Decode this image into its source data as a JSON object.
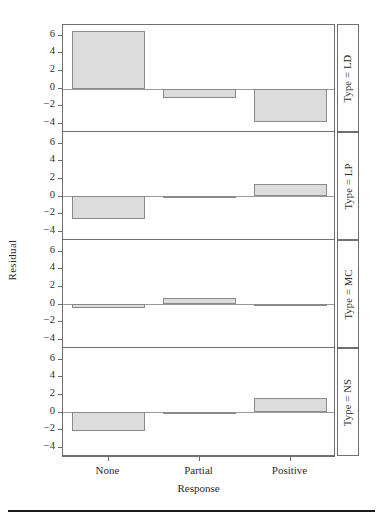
{
  "chart_data": {
    "type": "bar",
    "title": "",
    "subtitle": "",
    "xlabel": "Response",
    "ylabel": "Residual",
    "categories": [
      "None",
      "Partial",
      "Positive"
    ],
    "ylim": [
      -5,
      7.2
    ],
    "yticks": [
      6,
      4,
      2,
      0,
      -2,
      -4
    ],
    "ytick_labels": [
      "6",
      "4",
      "2",
      "0",
      "-2",
      "-4"
    ],
    "grid": false,
    "legend": null,
    "facet_variable": "Type",
    "panels": [
      {
        "label": "Type = LD",
        "facet_value": "LD",
        "values": [
          6.5,
          -1.0,
          -3.8
        ]
      },
      {
        "label": "Type = LP",
        "facet_value": "LP",
        "values": [
          -2.6,
          -0.15,
          1.3
        ]
      },
      {
        "label": "Type = MC",
        "facet_value": "MC",
        "values": [
          -0.45,
          0.65,
          -0.05
        ]
      },
      {
        "label": "Type = NS",
        "facet_value": "NS",
        "values": [
          -2.2,
          -0.2,
          1.5
        ]
      }
    ],
    "bar_fill_color": "#dcdcdc",
    "bar_edge_color": "#8a8a8a",
    "axis_color": "#6e6e6e"
  },
  "caption": {
    "rule": true,
    "text": ""
  }
}
